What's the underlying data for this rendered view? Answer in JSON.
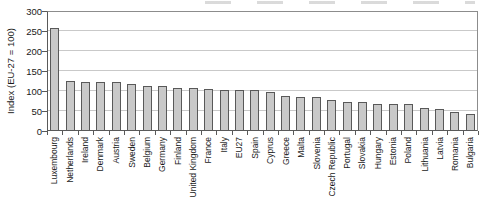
{
  "chart_data": {
    "type": "bar",
    "title": "",
    "xlabel": "",
    "ylabel": "Index (EU-27 = 100)",
    "ylim": [
      0,
      300
    ],
    "ytick_interval": 50,
    "ytick_labels": [
      "0",
      "50",
      "100",
      "150",
      "200",
      "250",
      "300"
    ],
    "grid": "horizontal-light",
    "legend": "none",
    "bar_fill_color": "#c9c9c9",
    "bar_border_color": "#595959",
    "gridline_color": "#c9c9c9",
    "axis_color": "#595959",
    "categories": [
      "Luxembourg",
      "Netherlands",
      "Ireland",
      "Denmark",
      "Austria",
      "Sweden",
      "Belgium",
      "Germany",
      "Finland",
      "United Kingdom",
      "France",
      "Italy",
      "EU27",
      "Spain",
      "Cyprus",
      "Greece",
      "Malta",
      "Slovenia",
      "Czech Republic",
      "Portugal",
      "Slovakia",
      "Hungary",
      "Estonia",
      "Poland",
      "Lithuania",
      "Latvia",
      "Romania",
      "Bulgaria"
    ],
    "values": [
      256,
      122,
      120,
      120,
      119,
      115,
      111,
      110,
      106,
      104,
      102,
      101,
      100,
      99,
      95,
      85,
      83,
      82,
      74,
      71,
      69,
      64,
      65,
      65,
      55,
      52,
      44,
      40
    ]
  }
}
